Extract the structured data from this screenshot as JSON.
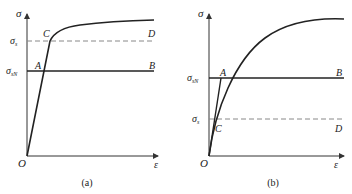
{
  "figure": {
    "panel_a": {
      "caption": "(a)",
      "y_axis_label": "σ",
      "x_axis_label": "ε",
      "origin_label": "O",
      "sigma_s_label": "σ",
      "sigma_s_sub": "s",
      "sigma_sN_label": "σ",
      "sigma_sN_sub": "sN",
      "point_A": "A",
      "point_B": "B",
      "point_C": "C",
      "point_D": "D"
    },
    "panel_b": {
      "caption": "(b)",
      "y_axis_label": "σ",
      "x_axis_label": "ε",
      "origin_label": "O",
      "sigma_s_label": "σ",
      "sigma_s_sub": "s",
      "sigma_sN_label": "σ",
      "sigma_sN_sub": "sN",
      "point_A": "A",
      "point_B": "B",
      "point_C": "C",
      "point_D": "D"
    },
    "colors": {
      "curve": "#222222",
      "axis": "#333333",
      "dashed": "#888888"
    }
  }
}
